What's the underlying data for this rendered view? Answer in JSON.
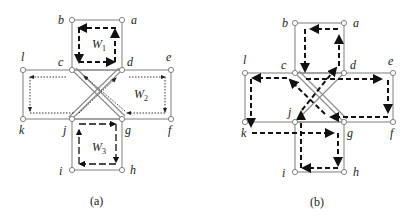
{
  "figure_a": {
    "caption": "(a)",
    "nodes": [
      {
        "id": "a",
        "label": "a",
        "x": 122,
        "y": 20
      },
      {
        "id": "b",
        "label": "b",
        "x": 72,
        "y": 20
      },
      {
        "id": "c",
        "label": "c",
        "x": 72,
        "y": 70
      },
      {
        "id": "d",
        "label": "d",
        "x": 122,
        "y": 70
      },
      {
        "id": "e",
        "label": "e",
        "x": 171,
        "y": 70
      },
      {
        "id": "f",
        "label": "f",
        "x": 171,
        "y": 119
      },
      {
        "id": "g",
        "label": "g",
        "x": 122,
        "y": 119
      },
      {
        "id": "h",
        "label": "h",
        "x": 122,
        "y": 170
      },
      {
        "id": "i",
        "label": "i",
        "x": 72,
        "y": 170
      },
      {
        "id": "j",
        "label": "j",
        "x": 72,
        "y": 119
      },
      {
        "id": "k",
        "label": "k",
        "x": 23,
        "y": 119
      },
      {
        "id": "l",
        "label": "l",
        "x": 23,
        "y": 70
      }
    ],
    "walks": [
      {
        "name": "W1",
        "label": "W",
        "sub": "1"
      },
      {
        "name": "W2",
        "label": "W",
        "sub": "2"
      },
      {
        "name": "W3",
        "label": "W",
        "sub": "3"
      }
    ]
  },
  "figure_b": {
    "caption": "(b)",
    "nodes": [
      {
        "id": "a",
        "label": "a",
        "x": 344,
        "y": 23
      },
      {
        "id": "b",
        "label": "b",
        "x": 295,
        "y": 23
      },
      {
        "id": "c",
        "label": "c",
        "x": 295,
        "y": 73
      },
      {
        "id": "d",
        "label": "d",
        "x": 344,
        "y": 73
      },
      {
        "id": "e",
        "label": "e",
        "x": 393,
        "y": 73
      },
      {
        "id": "f",
        "label": "f",
        "x": 393,
        "y": 122
      },
      {
        "id": "g",
        "label": "g",
        "x": 344,
        "y": 122
      },
      {
        "id": "h",
        "label": "h",
        "x": 344,
        "y": 172
      },
      {
        "id": "i",
        "label": "i",
        "x": 295,
        "y": 172
      },
      {
        "id": "j",
        "label": "j",
        "x": 295,
        "y": 122
      },
      {
        "id": "k",
        "label": "k",
        "x": 245,
        "y": 122
      },
      {
        "id": "l",
        "label": "l",
        "x": 245,
        "y": 73
      }
    ]
  }
}
